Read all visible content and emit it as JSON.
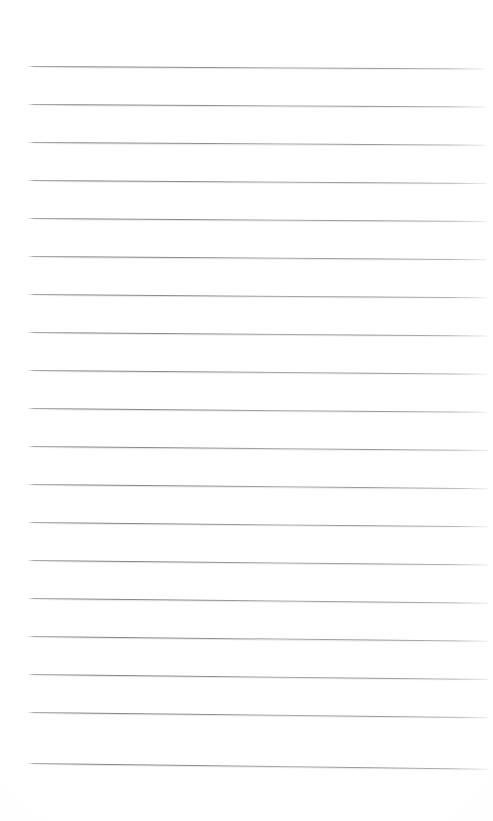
{
  "document": {
    "type": "ruled-notebook-paper",
    "title": "Blank ruled paper sheet",
    "content_text": "",
    "has_handwriting": false,
    "has_printed_text": false,
    "page_width_px": 493,
    "page_height_px": 821,
    "background_color": "#ffffff",
    "rule_line_color": "#808084",
    "rule_line_thickness_px": 1,
    "rule_line_count": 19,
    "rule_spacing_px": 37.8,
    "left_margin_px": 28,
    "right_edge_px": 487,
    "first_line_y_px": 66,
    "last_line_y_px": 765,
    "line_tilt_deg": 0.5,
    "margin_rule_present": false
  },
  "lines": [
    {
      "index": 1,
      "y": 66,
      "left": 28,
      "right": 484,
      "tilt": 0.3,
      "content": ""
    },
    {
      "index": 2,
      "y": 104,
      "left": 28,
      "right": 485,
      "tilt": 0.32,
      "content": ""
    },
    {
      "index": 3,
      "y": 142,
      "left": 28,
      "right": 485,
      "tilt": 0.34,
      "content": ""
    },
    {
      "index": 4,
      "y": 180,
      "left": 28,
      "right": 486,
      "tilt": 0.36,
      "content": ""
    },
    {
      "index": 5,
      "y": 218,
      "left": 28,
      "right": 486,
      "tilt": 0.38,
      "content": ""
    },
    {
      "index": 6,
      "y": 256,
      "left": 28,
      "right": 486,
      "tilt": 0.4,
      "content": ""
    },
    {
      "index": 7,
      "y": 294,
      "left": 28,
      "right": 487,
      "tilt": 0.42,
      "content": ""
    },
    {
      "index": 8,
      "y": 332,
      "left": 28,
      "right": 487,
      "tilt": 0.44,
      "content": ""
    },
    {
      "index": 9,
      "y": 370,
      "left": 28,
      "right": 487,
      "tilt": 0.46,
      "content": ""
    },
    {
      "index": 10,
      "y": 408,
      "left": 28,
      "right": 487,
      "tilt": 0.48,
      "content": ""
    },
    {
      "index": 11,
      "y": 446,
      "left": 28,
      "right": 488,
      "tilt": 0.5,
      "content": ""
    },
    {
      "index": 12,
      "y": 484,
      "left": 28,
      "right": 488,
      "tilt": 0.52,
      "content": ""
    },
    {
      "index": 13,
      "y": 522,
      "left": 28,
      "right": 488,
      "tilt": 0.54,
      "content": ""
    },
    {
      "index": 14,
      "y": 560,
      "left": 28,
      "right": 488,
      "tilt": 0.56,
      "content": ""
    },
    {
      "index": 15,
      "y": 598,
      "left": 28,
      "right": 489,
      "tilt": 0.58,
      "content": ""
    },
    {
      "index": 16,
      "y": 636,
      "left": 28,
      "right": 489,
      "tilt": 0.6,
      "content": ""
    },
    {
      "index": 17,
      "y": 674,
      "left": 28,
      "right": 489,
      "tilt": 0.62,
      "content": ""
    },
    {
      "index": 18,
      "y": 712,
      "left": 28,
      "right": 489,
      "tilt": 0.64,
      "content": ""
    },
    {
      "index": 19,
      "y": 763,
      "left": 28,
      "right": 489,
      "tilt": 0.7,
      "content": ""
    }
  ]
}
